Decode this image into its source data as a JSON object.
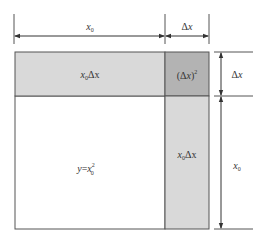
{
  "diagram": {
    "colors": {
      "background": "#ffffff",
      "outline": "#555555",
      "strip_fill": "#d9d9d9",
      "corner_fill": "#b3b3b3",
      "main_fill": "#ffffff",
      "text": "#333333"
    },
    "dimensions": {
      "top_left": {
        "var": "x",
        "sub": "0"
      },
      "top_right": {
        "prefix": "Δ",
        "var": "x"
      },
      "right_top": {
        "prefix": "Δ",
        "var": "x"
      },
      "right_bottom": {
        "var": "x",
        "sub": "0"
      }
    },
    "regions": {
      "top_strip": {
        "name": "x0Δx",
        "var": "x",
        "sub": "0",
        "suffix": "Δx"
      },
      "corner": {
        "open": "(Δ",
        "var": "x",
        "close": ")",
        "sup": "2"
      },
      "right_strip": {
        "name": "x0Δx",
        "var": "x",
        "sub": "0",
        "suffix": "Δx"
      },
      "main_square": {
        "lhs": "y",
        "eq": "=",
        "var": "x",
        "sub": "0",
        "sup": "2"
      }
    }
  }
}
